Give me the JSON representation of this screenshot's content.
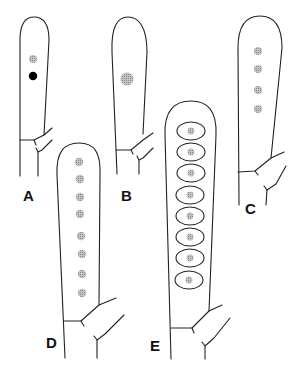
{
  "figure": {
    "colors": {
      "outline": "#222222",
      "nucleus_stippled": "#a8a8a8",
      "nucleus_solid": "#000000",
      "background": "#ffffff"
    },
    "panels": [
      {
        "id": "A",
        "label": "A",
        "nuclei": [
          {
            "type": "stippled",
            "count": 1
          },
          {
            "type": "solid",
            "count": 1
          }
        ],
        "total_nuclei": 2
      },
      {
        "id": "B",
        "label": "B",
        "nuclei": [
          {
            "type": "stippled",
            "count": 1,
            "size": "large"
          }
        ],
        "total_nuclei": 1
      },
      {
        "id": "C",
        "label": "C",
        "nuclei": [
          {
            "type": "stippled",
            "count": 4
          }
        ],
        "total_nuclei": 4
      },
      {
        "id": "D",
        "label": "D",
        "nuclei": [
          {
            "type": "stippled",
            "count": 8
          }
        ],
        "total_nuclei": 8
      },
      {
        "id": "E",
        "label": "E",
        "nuclei": [
          {
            "type": "stippled",
            "count": 8,
            "enclosed_in_spores": true
          }
        ],
        "total_nuclei": 8,
        "spores": 8
      }
    ]
  }
}
